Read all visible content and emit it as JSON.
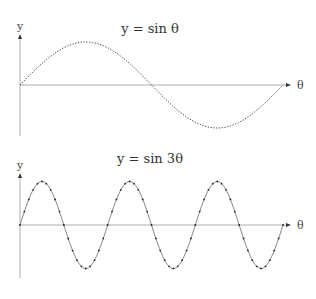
{
  "chart_data": [
    {
      "type": "line",
      "title": "y = sin θ",
      "xlabel": "θ",
      "ylabel": "y",
      "function": "sin(θ)",
      "x_range": [
        0,
        6.283
      ],
      "ylim": [
        -1,
        1
      ],
      "grid": false,
      "legend": null,
      "series": [
        {
          "name": "sin θ",
          "style": "dotted",
          "x": [
            0,
            0.785,
            1.571,
            2.356,
            3.142,
            3.927,
            4.712,
            5.498,
            6.283
          ],
          "values": [
            0,
            0.707,
            1,
            0.707,
            0,
            -0.707,
            -1,
            -0.707,
            0
          ]
        }
      ]
    },
    {
      "type": "line",
      "title": "y = sin 3θ",
      "xlabel": "θ",
      "ylabel": "y",
      "function": "sin(3θ)",
      "x_range": [
        0,
        6.283
      ],
      "ylim": [
        -1,
        1
      ],
      "grid": false,
      "legend": null,
      "series": [
        {
          "name": "sin 3θ",
          "style": "solid with dot markers",
          "x": [
            0,
            0.524,
            1.047,
            1.571,
            2.094,
            2.618,
            3.142,
            3.665,
            4.189,
            4.712,
            5.236,
            5.76,
            6.283
          ],
          "values": [
            0,
            1,
            0,
            -1,
            0,
            1,
            0,
            -1,
            0,
            1,
            0,
            -1,
            0
          ]
        }
      ]
    }
  ],
  "plots": {
    "top": {
      "title": "y = sin θ",
      "x_label": "θ",
      "y_label": "y"
    },
    "bottom": {
      "title": "y = sin 3θ",
      "x_label": "θ",
      "y_label": "y"
    }
  }
}
